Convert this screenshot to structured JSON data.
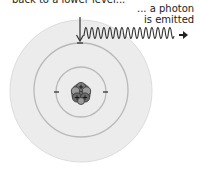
{
  "captions": {
    "top": "back to a lower level...",
    "photon_line1": "... a photon",
    "photon_line2": "is emitted"
  },
  "diagram": {
    "nucleus_symbols": [
      "+",
      "+",
      "+"
    ],
    "electron_symbol": "-",
    "icons": [
      "down-arrow-icon",
      "photon-wave-icon",
      "right-arrow-icon"
    ],
    "colors": {
      "outer_disc": "#ececec",
      "ring": "#b9b9b9",
      "nucleus": "#555555",
      "line": "#333333"
    }
  }
}
